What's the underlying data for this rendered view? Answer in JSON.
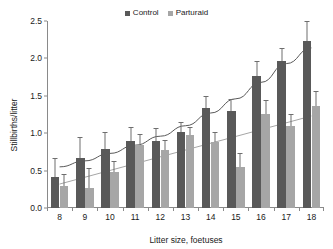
{
  "chart_data": {
    "type": "bar",
    "title": "",
    "xlabel": "Litter size, foetuses",
    "ylabel": "Stillbirths/litter",
    "categories": [
      "8",
      "9",
      "10",
      "11",
      "12",
      "13",
      "14",
      "15",
      "16",
      "17",
      "18"
    ],
    "ylim": [
      0,
      2.5
    ],
    "yticks": [
      "0.0",
      "0.5",
      "1.0",
      "1.5",
      "2.0",
      "2.5"
    ],
    "ytick_values": [
      0,
      0.5,
      1.0,
      1.5,
      2.0,
      2.5
    ],
    "grid": false,
    "legend_position": "top-center",
    "series": [
      {
        "name": "Control",
        "color": "#595959",
        "values": [
          0.42,
          0.67,
          0.79,
          0.89,
          0.9,
          1.01,
          1.34,
          1.3,
          1.77,
          1.96,
          2.23
        ],
        "errors": [
          0.24,
          0.26,
          0.21,
          0.18,
          0.16,
          0.12,
          0.14,
          0.15,
          0.18,
          0.16,
          0.26
        ]
      },
      {
        "name": "Parturaid",
        "color": "#a6a6a6",
        "values": [
          0.29,
          0.27,
          0.48,
          0.84,
          0.78,
          0.97,
          0.88,
          0.55,
          1.26,
          1.09,
          1.37
        ],
        "errors": [
          0.15,
          0.25,
          0.13,
          0.13,
          0.12,
          0.1,
          0.12,
          0.17,
          0.17,
          0.16,
          0.18
        ]
      }
    ],
    "trendlines": [
      {
        "name": "Control trend",
        "color": "#595959",
        "style": "curved",
        "points": [
          [
            0,
            0.55
          ],
          [
            1,
            0.63
          ],
          [
            2,
            0.73
          ],
          [
            3,
            0.84
          ],
          [
            4,
            0.96
          ],
          [
            5,
            1.1
          ],
          [
            6,
            1.27
          ],
          [
            7,
            1.46
          ],
          [
            8,
            1.68
          ],
          [
            9,
            1.93
          ],
          [
            10,
            2.14
          ]
        ]
      },
      {
        "name": "Parturaid trend",
        "color": "#a6a6a6",
        "style": "linear",
        "points": [
          [
            0,
            0.32
          ],
          [
            10,
            1.23
          ]
        ]
      }
    ]
  },
  "legend": {
    "entries": [
      {
        "label": "Control",
        "color": "#595959",
        "swatch": "square-marker-icon"
      },
      {
        "label": "Parturaid",
        "color": "#a6a6a6",
        "swatch": "square-marker-icon"
      }
    ]
  }
}
